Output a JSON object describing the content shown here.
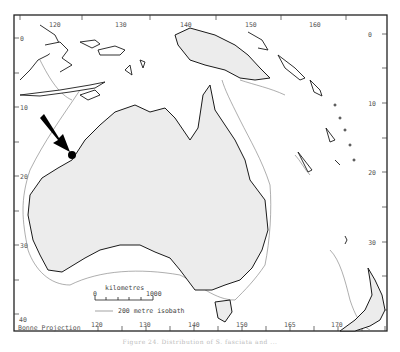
{
  "map": {
    "projection_label": "Bonne Projection",
    "colors": {
      "land": "#ececec",
      "coast": "#1a1a1a",
      "isobath": "#666666",
      "frame": "#222222",
      "marker": "#000000"
    },
    "top_longitudes": [
      "120",
      "130",
      "140",
      "150",
      "160"
    ],
    "bottom_longitudes": [
      "120",
      "130",
      "140",
      "150",
      "165",
      "170"
    ],
    "left_latitudes": [
      "0",
      "10",
      "20",
      "30",
      "40"
    ],
    "right_latitudes": [
      "0",
      "10",
      "20",
      "30"
    ],
    "scale_bar": {
      "title": "kilometres",
      "start": "0",
      "end": "1000"
    },
    "isobath_legend": "200 metre isobath",
    "marker": {
      "type": "arrow-and-dot",
      "location": "north-west Western Australia coast"
    }
  },
  "caption": "Figure 24. Distribution of S. fasciata and ..."
}
